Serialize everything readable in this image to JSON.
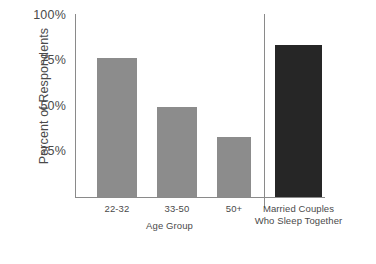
{
  "chart_data": {
    "type": "bar",
    "title": "",
    "subtitle": "",
    "xlabel": "Age Group",
    "ylabel": "Percent of Respondents",
    "categories": [
      "22-32",
      "33-50",
      "50+",
      "Married Couples\nWho Sleep Together"
    ],
    "values": [
      76,
      49,
      33,
      83
    ],
    "ylim": [
      0,
      100
    ],
    "yticks": [
      25,
      50,
      75,
      100
    ],
    "ytick_labels": [
      "25%",
      "50%",
      "75%",
      "100%"
    ],
    "grid": false,
    "legend": null,
    "series": [
      {
        "name": "Percent of Respondents",
        "values": [
          76,
          49,
          33,
          83
        ]
      }
    ],
    "annotations": [
      {
        "type": "vertical-separator",
        "note": "divides the three Age Group bars from the Married Couples bar"
      }
    ],
    "colors": {
      "bar_light": "#8c8c8c",
      "bar_dark": "#262626",
      "axis": "#8a8a8a",
      "text": "#4a4a4a",
      "background": "#ffffff"
    }
  },
  "axis": {
    "y_title": "Percent of Respondents",
    "x_title": "Age Group",
    "ticks": {
      "t100": "100%",
      "t75": "75%",
      "t50": "50%",
      "t25": "25%"
    }
  },
  "bars": [
    {
      "label": "22-32",
      "value": 76,
      "display": "76%",
      "shade": "light"
    },
    {
      "label": "33-50",
      "value": 49,
      "display": "49%",
      "shade": "light"
    },
    {
      "label": "50+",
      "value": 33,
      "display": "33%",
      "shade": "light"
    },
    {
      "label_line1": "Married Couples",
      "label_line2": "Who Sleep Together",
      "value": 83,
      "display": "83%",
      "shade": "dark"
    }
  ]
}
